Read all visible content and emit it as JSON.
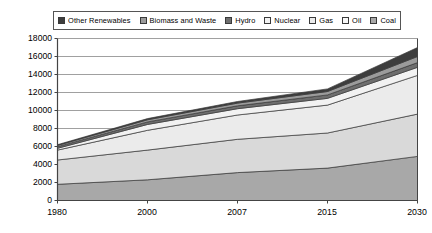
{
  "chart_data": {
    "type": "area",
    "stacked": true,
    "title": "",
    "subtitle": "",
    "xlabel": "",
    "ylabel": "",
    "categories": [
      "1980",
      "2000",
      "2007",
      "2015",
      "2030"
    ],
    "x_tick_labels": [
      "1980",
      "2000",
      "2007",
      "2015",
      "2030"
    ],
    "y_tick_labels": [
      "0",
      "2000",
      "4000",
      "6000",
      "8000",
      "10000",
      "12000",
      "14000",
      "16000",
      "18000"
    ],
    "y_ticks": [
      0,
      2000,
      4000,
      6000,
      8000,
      10000,
      12000,
      14000,
      16000,
      18000
    ],
    "ylim": [
      0,
      18000
    ],
    "grid": true,
    "grid_axis": "y",
    "legend_position": "top",
    "legend_entries": [
      "Other Renewables",
      "Biomass and Waste",
      "Hydro",
      "Nuclear",
      "Gas",
      "Oil",
      "Coal"
    ],
    "stack_order_bottom_to_top": [
      "Coal",
      "Oil",
      "Gas",
      "Nuclear",
      "Hydro",
      "Biomass and Waste",
      "Other Renewables"
    ],
    "series": [
      {
        "name": "Coal",
        "color": "#a8a8a8",
        "values": [
          1800,
          2300,
          3100,
          3600,
          4900
        ]
      },
      {
        "name": "Oil",
        "color": "#d9d9d9",
        "values": [
          2700,
          3300,
          3700,
          3900,
          4700
        ]
      },
      {
        "name": "Gas",
        "color": "#ebebeb",
        "values": [
          1100,
          2200,
          2700,
          3100,
          4300
        ]
      },
      {
        "name": "Nuclear",
        "color": "#f2f2f2",
        "values": [
          200,
          650,
          700,
          750,
          900
        ]
      },
      {
        "name": "Hydro",
        "color": "#6e6e6e",
        "values": [
          180,
          280,
          320,
          380,
          520
        ]
      },
      {
        "name": "Biomass and Waste",
        "color": "#9b9b9b",
        "values": [
          140,
          240,
          300,
          380,
          680
        ]
      },
      {
        "name": "Other Renewables",
        "color": "#3d3d3d",
        "values": [
          80,
          130,
          180,
          290,
          1000
        ]
      }
    ],
    "totals": [
      6200,
      9100,
      11000,
      12400,
      17000
    ]
  },
  "legend": {
    "items": [
      {
        "label": "Other Renewables",
        "icon": "legend-swatch-icon",
        "color": "#3d3d3d"
      },
      {
        "label": "Biomass and Waste",
        "icon": "legend-swatch-icon",
        "color": "#9b9b9b"
      },
      {
        "label": "Hydro",
        "icon": "legend-swatch-icon",
        "color": "#6e6e6e"
      },
      {
        "label": "Nuclear",
        "icon": "legend-swatch-icon",
        "color": "#f2f2f2"
      },
      {
        "label": "Gas",
        "icon": "legend-swatch-icon",
        "color": "#ebebeb"
      },
      {
        "label": "Oil",
        "icon": "legend-swatch-icon",
        "color": "#f7f7f7"
      },
      {
        "label": "Coal",
        "icon": "legend-swatch-icon",
        "color": "#a8a8a8"
      }
    ]
  },
  "axes": {
    "y_labels": [
      "18000",
      "16000",
      "14000",
      "12000",
      "10000",
      "8000",
      "6000",
      "4000",
      "2000",
      "0"
    ],
    "x_labels": [
      "1980",
      "2000",
      "2007",
      "2015",
      "2030"
    ]
  },
  "style": {
    "plot_border": "#444444",
    "gridline": "#888888",
    "background": "#ffffff"
  }
}
